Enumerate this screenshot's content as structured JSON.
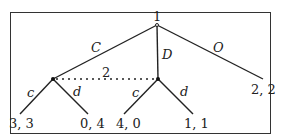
{
  "tree": {
    "root_player": "1",
    "info_set_player": "2",
    "root_actions": [
      "C",
      "D",
      "O"
    ],
    "player2_actions_left": [
      "c",
      "d"
    ],
    "player2_actions_right": [
      "c",
      "d"
    ],
    "payoffs": {
      "C_c": "3, 3",
      "C_d": "0, 4",
      "D_c": "4, 0",
      "D_d": "1, 1",
      "O": "2, 2"
    }
  }
}
